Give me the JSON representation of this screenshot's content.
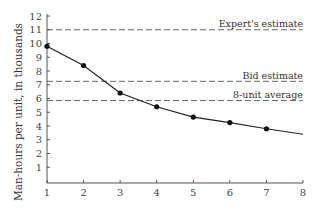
{
  "chart_data": {
    "type": "line",
    "title": "",
    "xlabel": "",
    "ylabel": "Man-hours per unit, in thousands",
    "x": [
      1,
      2,
      3,
      4,
      5,
      6,
      7,
      8
    ],
    "xticks": [
      "1",
      "2",
      "3",
      "4",
      "5",
      "6",
      "7",
      "8"
    ],
    "yticks": [
      "1",
      "2",
      "3",
      "4",
      "5",
      "6",
      "7",
      "8",
      "9",
      "10",
      "11",
      "12"
    ],
    "xlim": [
      1,
      8
    ],
    "ylim": [
      0,
      12
    ],
    "grid": false,
    "series": [
      {
        "name": "Learning curve",
        "x": [
          1,
          2,
          3,
          4,
          5,
          6,
          7
        ],
        "values": [
          9.8,
          8.4,
          6.4,
          5.4,
          4.65,
          4.25,
          3.8
        ],
        "curve_end": {
          "x": 8,
          "y": 3.4
        },
        "markers": true
      }
    ],
    "reference_lines": [
      {
        "label": "Expert's estimate",
        "y": 11.0,
        "style": "dashed"
      },
      {
        "label": "Bid estimate",
        "y": 7.25,
        "style": "dashed"
      },
      {
        "label": "8-unit average",
        "y": 5.85,
        "style": "dashed"
      }
    ]
  },
  "colors": {
    "axis": "#555555",
    "line": "#222222",
    "marker": "#111111",
    "dashed": "#666666"
  }
}
